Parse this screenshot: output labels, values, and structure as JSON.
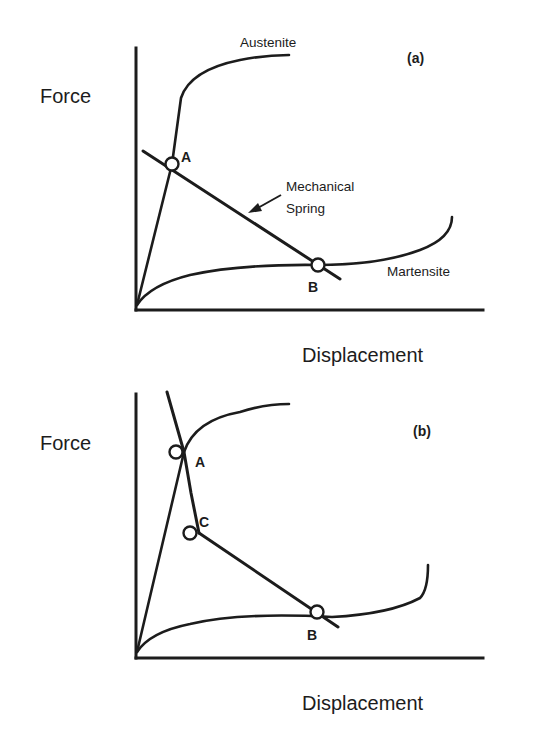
{
  "figure": {
    "panels": [
      {
        "id": "a",
        "panel_label": "(a)",
        "y_axis_label": "Force",
        "x_axis_label": "Displacement",
        "curves": {
          "austenite_label": "Austenite",
          "martensite_label": "Martensite",
          "spring_label_line1": "Mechanical",
          "spring_label_line2": "Spring"
        },
        "points": [
          {
            "name": "A",
            "label": "A"
          },
          {
            "name": "B",
            "label": "B"
          }
        ]
      },
      {
        "id": "b",
        "panel_label": "(b)",
        "y_axis_label": "Force",
        "x_axis_label": "Displacement",
        "points": [
          {
            "name": "A",
            "label": "A"
          },
          {
            "name": "C",
            "label": "C"
          },
          {
            "name": "B",
            "label": "B"
          }
        ]
      }
    ],
    "colors": {
      "ink": "#1c1c1c",
      "background": "#ffffff"
    }
  }
}
